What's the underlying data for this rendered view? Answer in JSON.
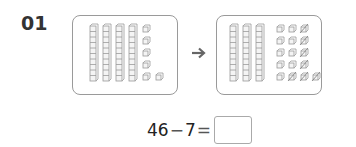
{
  "question": {
    "number": "01",
    "before": {
      "tens_rods": 4,
      "ones_cubes": 6,
      "label": "46 shown as base-ten blocks"
    },
    "after": {
      "tens_rods": 3,
      "ones_cubes": 16,
      "crossed_out": 7,
      "label": "regrouped: 3 tens and 16 ones, 7 crossed out"
    },
    "arrow_icon": "right-arrow-icon",
    "equation": {
      "minuend": "46",
      "operator": "−",
      "subtrahend": "7",
      "equals": "=",
      "answer": ""
    },
    "colors": {
      "block_stroke": "#9a9a9a",
      "box_border": "#9a9a9a",
      "number": "#333333"
    }
  }
}
